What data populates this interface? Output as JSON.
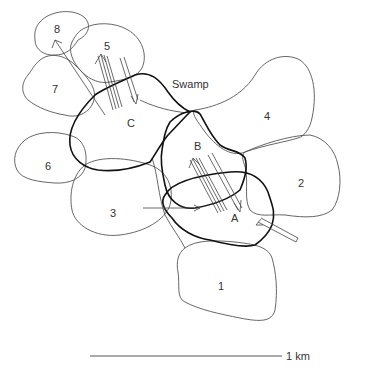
{
  "diagram": {
    "labels": {
      "swamp": "Swamp",
      "range_1": "1",
      "range_2": "2",
      "range_3": "3",
      "range_4": "4",
      "range_5": "5",
      "range_6": "6",
      "range_7": "7",
      "range_8": "8",
      "range_A": "A",
      "range_B": "B",
      "range_C": "C"
    },
    "scale_bar": {
      "label": "1 km"
    },
    "colors": {
      "background": "#ffffff",
      "thin_outline": "#555555",
      "thick_outline": "#111111"
    }
  }
}
